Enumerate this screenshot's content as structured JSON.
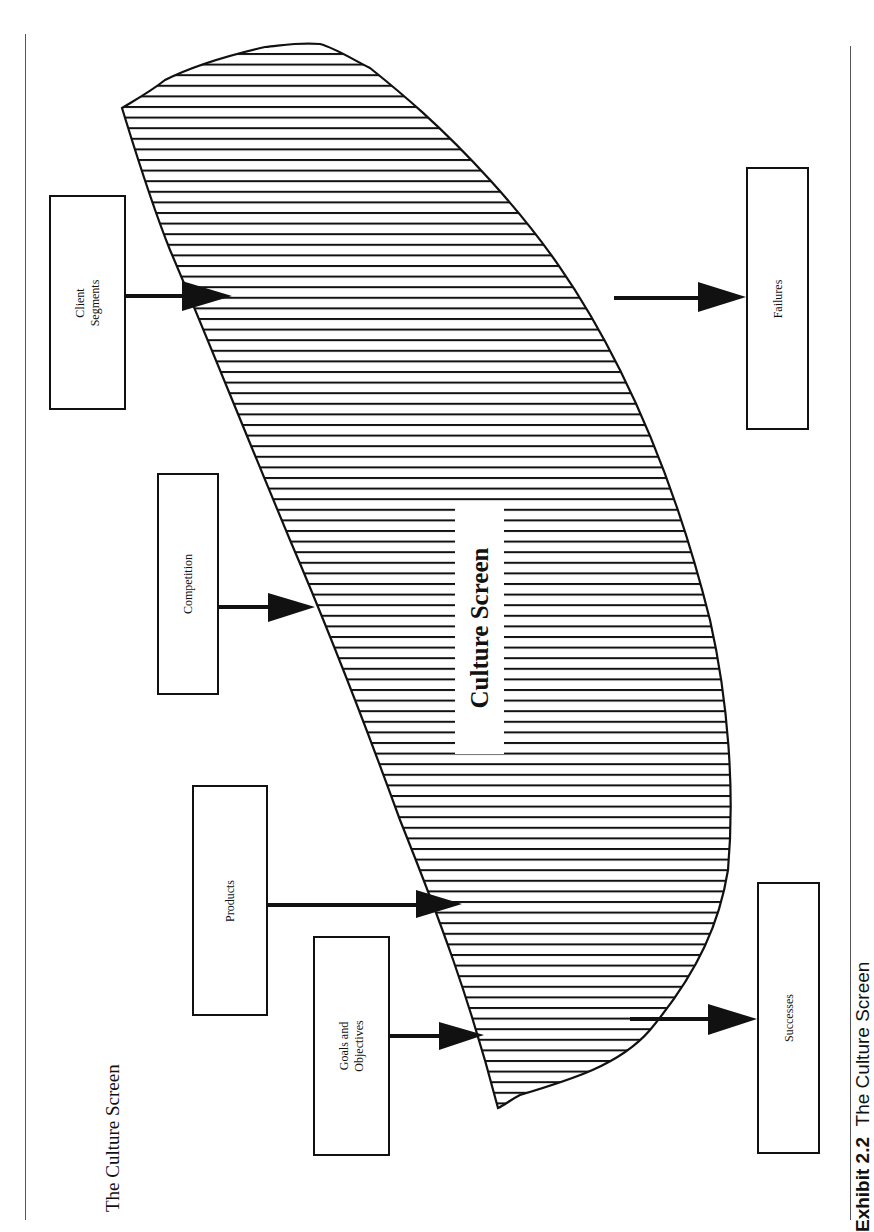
{
  "page": {
    "title": "The Culture Screen",
    "caption_label": "Exhibit 2.2",
    "caption_text": "The Culture Screen"
  },
  "center": {
    "label": "Culture Screen"
  },
  "inputs": [
    {
      "id": "client-segments",
      "lines": [
        "Client",
        "Segments"
      ]
    },
    {
      "id": "competition",
      "lines": [
        "Competition"
      ]
    },
    {
      "id": "products",
      "lines": [
        "Products"
      ]
    },
    {
      "id": "goals-objectives",
      "lines": [
        "Goals and",
        "Objectives"
      ]
    }
  ],
  "outputs": [
    {
      "id": "failures",
      "lines": [
        "Failures"
      ]
    },
    {
      "id": "successes",
      "lines": [
        "Successes"
      ]
    }
  ],
  "colors": {
    "stroke": "#111111",
    "rule": "#555555",
    "background": "#ffffff"
  }
}
